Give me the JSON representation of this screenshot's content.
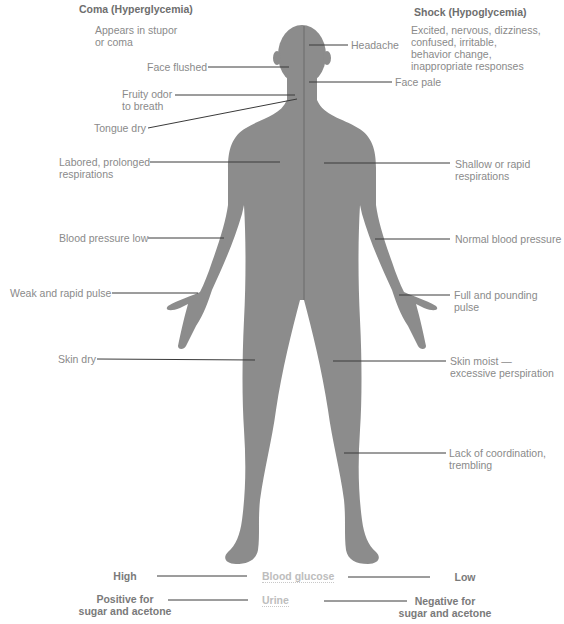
{
  "left_column": {
    "title": "Coma (Hyperglycemia)",
    "subtitle": "Appears in stupor\nor coma",
    "signs": [
      {
        "label": "Face flushed"
      },
      {
        "label": "Fruity odor\nto breath"
      },
      {
        "label": "Tongue dry"
      },
      {
        "label": "Labored, prolonged\nrespirations"
      },
      {
        "label": "Blood pressure low"
      },
      {
        "label": "Weak and rapid pulse"
      },
      {
        "label": "Skin dry"
      }
    ]
  },
  "right_column": {
    "title": "Shock (Hypoglycemia)",
    "subtitle": "Excited, nervous, dizziness,\nconfused, irritable,\nbehavior change,\ninappropriate responses",
    "signs": [
      {
        "label": "Headache"
      },
      {
        "label": "Face pale"
      },
      {
        "label": "Shallow or rapid\nrespirations"
      },
      {
        "label": "Normal blood pressure"
      },
      {
        "label": "Full and pounding pulse"
      },
      {
        "label": "Skin moist —\nexcessive perspiration"
      },
      {
        "label": "Lack of coordination,\ntrembling"
      }
    ]
  },
  "comparison": {
    "blood_glucose": {
      "label": "Blood glucose",
      "left": "High",
      "right": "Low"
    },
    "urine": {
      "label": "Urine",
      "left": "Positive for\nsugar and acetone",
      "right": "Negative for\nsugar and acetone"
    }
  },
  "colors": {
    "body": "#8c8c8c",
    "leader_line": "#3a3a3a",
    "text": "#8a8a8a",
    "header": "#6e6e6e",
    "center_label": "#bdbdbd"
  }
}
